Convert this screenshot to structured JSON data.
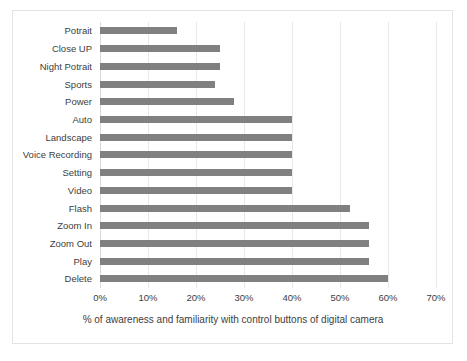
{
  "chart_data": {
    "type": "bar",
    "orientation": "horizontal",
    "title": "",
    "xlabel": "% of awareness and familiarity with control buttons of digital camera",
    "ylabel": "",
    "xlim": [
      0,
      70
    ],
    "xtick_labels": [
      "0%",
      "10%",
      "20%",
      "30%",
      "40%",
      "50%",
      "60%",
      "70%"
    ],
    "xticks": [
      0,
      10,
      20,
      30,
      40,
      50,
      60,
      70
    ],
    "grid": true,
    "legend": false,
    "bar_color": "#808080",
    "categories": [
      "Potrait",
      "Close UP",
      "Night Potrait",
      "Sports",
      "Power",
      "Auto",
      "Landscape",
      "Voice Recording",
      "Setting",
      "Video",
      "Flash",
      "Zoom In",
      "Zoom Out",
      "Play",
      "Delete"
    ],
    "values": [
      16,
      25,
      25,
      24,
      28,
      40,
      40,
      40,
      40,
      40,
      52,
      56,
      56,
      56,
      60
    ]
  }
}
